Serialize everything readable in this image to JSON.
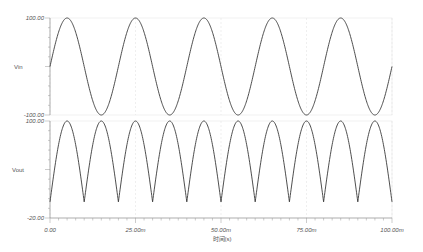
{
  "chart_data": [
    {
      "type": "line",
      "name": "Vin",
      "ylabel": "Vin",
      "ylim": [
        -100,
        100
      ],
      "ytick_labels": [
        "100.00",
        "-100.00"
      ],
      "xlim": [
        0,
        0.1
      ],
      "function": "100*sin(2*pi*50*t)",
      "frequency_hz": 50,
      "amplitude": 100,
      "x": [
        0,
        0.005,
        0.01,
        0.015,
        0.02,
        0.025,
        0.03,
        0.035,
        0.04,
        0.045,
        0.05,
        0.055,
        0.06,
        0.065,
        0.07,
        0.075,
        0.08,
        0.085,
        0.09,
        0.095,
        0.1
      ],
      "values": [
        0,
        100,
        0,
        -100,
        0,
        100,
        0,
        -100,
        0,
        100,
        0,
        -100,
        0,
        100,
        0,
        -100,
        0,
        100,
        0,
        -100,
        0
      ],
      "grid": true
    },
    {
      "type": "line",
      "name": "Vout",
      "ylabel": "Vout",
      "ylim": [
        -20,
        100
      ],
      "ytick_labels": [
        "100.00",
        "-20.00"
      ],
      "xlim": [
        0,
        0.1
      ],
      "function": "|100*sin(2*pi*50*t)|",
      "frequency_hz": 100,
      "amplitude": 100,
      "x": [
        0,
        0.005,
        0.01,
        0.015,
        0.02,
        0.025,
        0.03,
        0.035,
        0.04,
        0.045,
        0.05,
        0.055,
        0.06,
        0.065,
        0.07,
        0.075,
        0.08,
        0.085,
        0.09,
        0.095,
        0.1
      ],
      "values": [
        0,
        100,
        0,
        100,
        0,
        100,
        0,
        100,
        0,
        100,
        0,
        100,
        0,
        100,
        0,
        100,
        0,
        100,
        0,
        100,
        0
      ],
      "xlabel": "时间(s)",
      "xtick_labels": [
        "0.00",
        "25.00m",
        "50.00m",
        "75.00m",
        "100.00m"
      ],
      "xtick_values": [
        0,
        0.025,
        0.05,
        0.075,
        0.1
      ],
      "grid": true
    }
  ],
  "top": {
    "ylabel": "Vin",
    "ymax_label": "100.00",
    "ymin_label": "-100.00"
  },
  "bottom": {
    "ylabel": "Vout",
    "ymax_label": "100.00",
    "ymin_label": "-20.00"
  },
  "xaxis": {
    "title": "时间(s)",
    "ticks": [
      "0.00",
      "25.00m",
      "50.00m",
      "75.00m",
      "100.00m"
    ]
  },
  "colors": {
    "trace": "#3a3a3a",
    "axis": "#888888",
    "grid": "#e6e6e6"
  }
}
